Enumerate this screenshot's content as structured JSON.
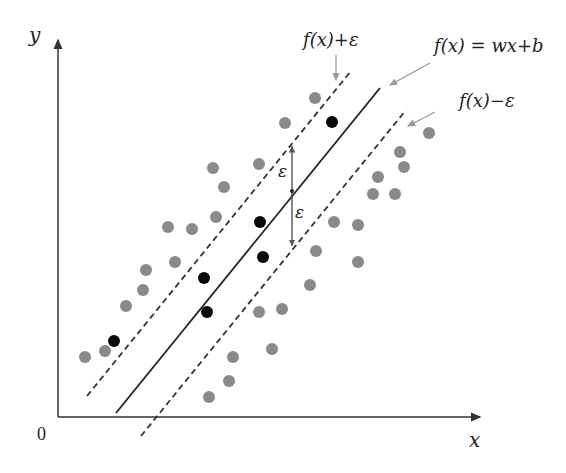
{
  "diagram": {
    "axes": {
      "x_label": "x",
      "y_label": "y",
      "origin_label": "0"
    },
    "labels": {
      "upper_bound": "f(x)+ε",
      "regression_line": "f(x) = wx+b",
      "lower_bound": "f(x)−ε",
      "epsilon_upper": "ε",
      "epsilon_lower": "ε"
    },
    "colors": {
      "axis": "#333333",
      "line": "#222222",
      "outside_point": "#8a8a8a",
      "support_point": "#0a0a0a",
      "arrow": "#999999"
    },
    "geometry": {
      "x_axis": {
        "x1": 58,
        "y1": 417,
        "x2": 480,
        "y2": 417
      },
      "y_axis": {
        "x1": 58,
        "y1": 417,
        "x2": 58,
        "y2": 38
      },
      "regression_line": {
        "x1": 116,
        "y1": 413,
        "x2": 380,
        "y2": 88
      },
      "upper_line": {
        "x1": 87,
        "y1": 396,
        "x2": 351,
        "y2": 71
      },
      "lower_line": {
        "x1": 141,
        "y1": 436,
        "x2": 406,
        "y2": 110
      },
      "epsilon_arrow": {
        "x": 292,
        "top": 144,
        "mid": 191,
        "bottom": 248
      }
    },
    "points_outside": [
      [
        85,
        357
      ],
      [
        105,
        351
      ],
      [
        126,
        306
      ],
      [
        143,
        290
      ],
      [
        146,
        270
      ],
      [
        168,
        227
      ],
      [
        175,
        262
      ],
      [
        192,
        229
      ],
      [
        213,
        168
      ],
      [
        216,
        217
      ],
      [
        224,
        187
      ],
      [
        259,
        164
      ],
      [
        285,
        123
      ],
      [
        315,
        98
      ],
      [
        209,
        397
      ],
      [
        229,
        381
      ],
      [
        233,
        357
      ],
      [
        259,
        312
      ],
      [
        272,
        349
      ],
      [
        282,
        309
      ],
      [
        310,
        285
      ],
      [
        316,
        251
      ],
      [
        334,
        222
      ],
      [
        358,
        225
      ],
      [
        358,
        262
      ],
      [
        373,
        194
      ],
      [
        378,
        177
      ],
      [
        400,
        152
      ],
      [
        404,
        167
      ],
      [
        395,
        194
      ],
      [
        429,
        133
      ]
    ],
    "points_support": [
      [
        114,
        341
      ],
      [
        204,
        278
      ],
      [
        207,
        312
      ],
      [
        260,
        222
      ],
      [
        263,
        257
      ],
      [
        332,
        122
      ]
    ]
  }
}
